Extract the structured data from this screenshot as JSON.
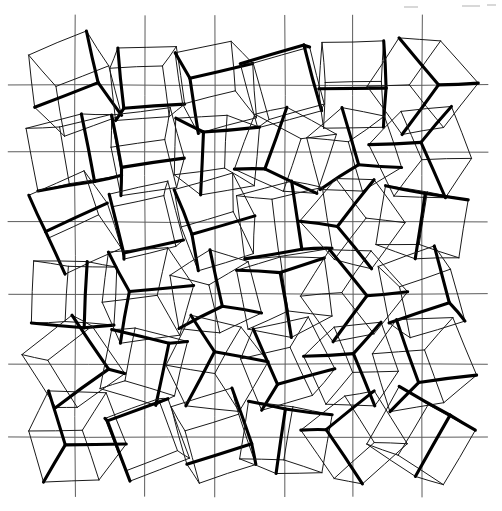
{
  "figure": {
    "rows": 6,
    "columns": 6,
    "cell_count": 36,
    "background_color": "#ffffff",
    "grid_line_color": "#5c5c5c",
    "cube_outline_color": "#1a1a1a",
    "cube_edge_color": "#000000",
    "canvas": {
      "width": 502,
      "height": 511
    }
  },
  "grid": {
    "vertical_x": [
      75,
      145,
      215,
      285,
      353,
      422
    ],
    "vertical_y_start": 15,
    "vertical_y_end": 497,
    "horizontal_y": [
      85,
      152,
      222,
      294,
      364,
      437
    ],
    "horizontal_x_start": 8,
    "horizontal_x_end": 488
  },
  "cubes": [
    {
      "id": "r1c1",
      "row": 1,
      "col": 1,
      "cx": 75,
      "cy": 85,
      "rot": -18,
      "scale": 1.06,
      "skew": 0.1,
      "flip": 1
    },
    {
      "id": "r1c2",
      "row": 1,
      "col": 2,
      "cx": 145,
      "cy": 85,
      "rot": 22,
      "scale": 0.96,
      "skew": -0.06,
      "flip": -1
    },
    {
      "id": "r1c3",
      "row": 1,
      "col": 3,
      "cx": 215,
      "cy": 85,
      "rot": -6,
      "scale": 1.0,
      "skew": 0.14,
      "flip": 1
    },
    {
      "id": "r1c4",
      "row": 1,
      "col": 4,
      "cx": 285,
      "cy": 85,
      "rot": 12,
      "scale": 1.04,
      "skew": -0.12,
      "flip": -1
    },
    {
      "id": "r1c5",
      "row": 1,
      "col": 5,
      "cx": 353,
      "cy": 85,
      "rot": -14,
      "scale": 1.02,
      "skew": 0.05,
      "flip": 1
    },
    {
      "id": "r1c6",
      "row": 1,
      "col": 6,
      "cx": 422,
      "cy": 85,
      "rot": 8,
      "scale": 1.08,
      "skew": 0.16,
      "flip": 1
    },
    {
      "id": "r2c1",
      "row": 2,
      "col": 1,
      "cx": 75,
      "cy": 152,
      "rot": 16,
      "scale": 1.05,
      "skew": -0.1,
      "flip": -1
    },
    {
      "id": "r2c2",
      "row": 2,
      "col": 2,
      "cx": 145,
      "cy": 152,
      "rot": -20,
      "scale": 0.98,
      "skew": 0.12,
      "flip": 1
    },
    {
      "id": "r2c3",
      "row": 2,
      "col": 3,
      "cx": 215,
      "cy": 152,
      "rot": 5,
      "scale": 1.0,
      "skew": -0.15,
      "flip": 1
    },
    {
      "id": "r2c4",
      "row": 2,
      "col": 4,
      "cx": 285,
      "cy": 152,
      "rot": -10,
      "scale": 1.03,
      "skew": 0.08,
      "flip": -1
    },
    {
      "id": "r2c5",
      "row": 2,
      "col": 5,
      "cx": 353,
      "cy": 152,
      "rot": 18,
      "scale": 0.97,
      "skew": -0.05,
      "flip": 1
    },
    {
      "id": "r2c6",
      "row": 2,
      "col": 6,
      "cx": 422,
      "cy": 152,
      "rot": -7,
      "scale": 1.05,
      "skew": 0.13,
      "flip": -1
    },
    {
      "id": "r3c1",
      "row": 3,
      "col": 1,
      "cx": 75,
      "cy": 222,
      "rot": -22,
      "scale": 1.02,
      "skew": 0.07,
      "flip": 1
    },
    {
      "id": "r3c2",
      "row": 3,
      "col": 2,
      "cx": 145,
      "cy": 222,
      "rot": 9,
      "scale": 0.95,
      "skew": -0.14,
      "flip": -1
    },
    {
      "id": "r3c3",
      "row": 3,
      "col": 3,
      "cx": 215,
      "cy": 222,
      "rot": -12,
      "scale": 1.0,
      "skew": 0.11,
      "flip": 1
    },
    {
      "id": "r3c4",
      "row": 3,
      "col": 4,
      "cx": 285,
      "cy": 222,
      "rot": 20,
      "scale": 1.06,
      "skew": -0.08,
      "flip": 1
    },
    {
      "id": "r3c5",
      "row": 3,
      "col": 5,
      "cx": 353,
      "cy": 222,
      "rot": -4,
      "scale": 1.01,
      "skew": 0.15,
      "flip": -1
    },
    {
      "id": "r3c6",
      "row": 3,
      "col": 6,
      "cx": 422,
      "cy": 222,
      "rot": 14,
      "scale": 0.99,
      "skew": -0.11,
      "flip": 1
    },
    {
      "id": "r4c1",
      "row": 4,
      "col": 1,
      "cx": 75,
      "cy": 294,
      "rot": 6,
      "scale": 1.0,
      "skew": -0.13,
      "flip": -1
    },
    {
      "id": "r4c2",
      "row": 4,
      "col": 2,
      "cx": 145,
      "cy": 294,
      "rot": -17,
      "scale": 1.07,
      "skew": 0.09,
      "flip": 1
    },
    {
      "id": "r4c3",
      "row": 4,
      "col": 3,
      "cx": 215,
      "cy": 294,
      "rot": 11,
      "scale": 0.96,
      "skew": 0.04,
      "flip": 1
    },
    {
      "id": "r4c4",
      "row": 4,
      "col": 4,
      "cx": 285,
      "cy": 294,
      "rot": -9,
      "scale": 1.02,
      "skew": -0.16,
      "flip": -1
    },
    {
      "id": "r4c5",
      "row": 4,
      "col": 5,
      "cx": 353,
      "cy": 294,
      "rot": 2,
      "scale": 1.04,
      "skew": 0.12,
      "flip": 1
    },
    {
      "id": "r4c6",
      "row": 4,
      "col": 6,
      "cx": 422,
      "cy": 294,
      "rot": -19,
      "scale": 1.0,
      "skew": -0.06,
      "flip": 1
    },
    {
      "id": "r5c1",
      "row": 5,
      "col": 1,
      "cx": 75,
      "cy": 364,
      "rot": 19,
      "scale": 1.03,
      "skew": 0.1,
      "flip": 1
    },
    {
      "id": "r5c2",
      "row": 5,
      "col": 2,
      "cx": 145,
      "cy": 364,
      "rot": -8,
      "scale": 0.98,
      "skew": -0.12,
      "flip": -1
    },
    {
      "id": "r5c3",
      "row": 5,
      "col": 3,
      "cx": 215,
      "cy": 364,
      "rot": 3,
      "scale": 1.05,
      "skew": 0.16,
      "flip": 1
    },
    {
      "id": "r5c4",
      "row": 5,
      "col": 4,
      "cx": 285,
      "cy": 364,
      "rot": -15,
      "scale": 1.01,
      "skew": -0.04,
      "flip": 1
    },
    {
      "id": "r5c5",
      "row": 5,
      "col": 5,
      "cx": 353,
      "cy": 364,
      "rot": 10,
      "scale": 0.97,
      "skew": 0.14,
      "flip": -1
    },
    {
      "id": "r5c6",
      "row": 5,
      "col": 6,
      "cx": 422,
      "cy": 364,
      "rot": -2,
      "scale": 1.09,
      "skew": 0.06,
      "flip": 1
    },
    {
      "id": "r6c1",
      "row": 6,
      "col": 1,
      "cx": 75,
      "cy": 437,
      "rot": -11,
      "scale": 1.06,
      "skew": 0.13,
      "flip": 1
    },
    {
      "id": "r6c2",
      "row": 6,
      "col": 2,
      "cx": 145,
      "cy": 437,
      "rot": 15,
      "scale": 1.0,
      "skew": -0.09,
      "flip": -1
    },
    {
      "id": "r6c3",
      "row": 6,
      "col": 3,
      "cx": 215,
      "cy": 437,
      "rot": -21,
      "scale": 1.02,
      "skew": 0.05,
      "flip": 1
    },
    {
      "id": "r6c4",
      "row": 6,
      "col": 4,
      "cx": 285,
      "cy": 437,
      "rot": 7,
      "scale": 0.99,
      "skew": -0.15,
      "flip": 1
    },
    {
      "id": "r6c5",
      "row": 6,
      "col": 5,
      "cx": 353,
      "cy": 437,
      "rot": -13,
      "scale": 1.04,
      "skew": 0.11,
      "flip": -1
    },
    {
      "id": "r6c6",
      "row": 6,
      "col": 6,
      "cx": 422,
      "cy": 437,
      "rot": 24,
      "scale": 1.07,
      "skew": -0.07,
      "flip": 1
    }
  ],
  "specks": [
    {
      "x": 404,
      "y": 6,
      "w": 14,
      "h": 2
    },
    {
      "x": 462,
      "y": 5,
      "w": 18,
      "h": 2
    },
    {
      "x": 487,
      "y": 4,
      "w": 9,
      "h": 2
    }
  ]
}
